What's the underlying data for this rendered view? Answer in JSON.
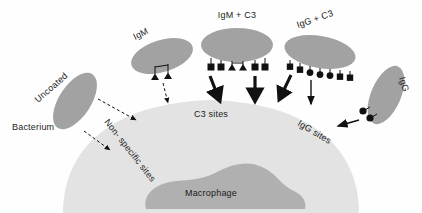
{
  "figure": {
    "background_color": "#fefefe"
  },
  "colors": {
    "bacterium_fill": "#a2a2a2",
    "macrophage_body_fill": "#e3e3e3",
    "macrophage_nucleus_fill": "#b0b0b0",
    "marker_color": "#111111",
    "arrow_color": "#111111",
    "text_color": "#1b1b1b"
  },
  "labels": {
    "bacterium": "Bacterium",
    "uncoated": "Uncoated",
    "igm": "IgM",
    "igm_c3": "IgM + C3",
    "igg_c3": "IgG + C3",
    "igg": "IgG",
    "nonspecific_sites": "Non- specific  sites",
    "c3_sites": "C3 sites",
    "igg_sites": "IgG sites",
    "macrophage": "Macrophage"
  },
  "bacteria": [
    {
      "id": "uncoated",
      "label": "Uncoated",
      "coating": "none",
      "marker_count": 0,
      "arrow_style": "dashed",
      "arrow_count": 2,
      "target": "Non- specific  sites"
    },
    {
      "id": "igm",
      "label": "IgM",
      "coating": "IgM",
      "marker_shapes": [
        "triangle",
        "triangle"
      ],
      "marker_count": 2,
      "arrow_style": "dashed",
      "arrow_count": 1,
      "target": "Non- specific  sites"
    },
    {
      "id": "igm-c3",
      "label": "IgM + C3",
      "coating": "IgM + C3",
      "marker_shapes": [
        "square",
        "square",
        "triangle",
        "triangle",
        "square",
        "square"
      ],
      "marker_count": 6,
      "arrow_style": "thick-solid",
      "arrow_count": 2,
      "target": "C3 sites"
    },
    {
      "id": "igg-c3",
      "label": "IgG + C3",
      "coating": "IgG + C3",
      "marker_shapes": [
        "square",
        "square",
        "circle",
        "circle",
        "circle",
        "square",
        "square"
      ],
      "marker_count": 7,
      "arrow_style": "mixed-solid",
      "arrow_count": 2,
      "target": "C3 sites"
    },
    {
      "id": "igg",
      "label": "IgG",
      "coating": "IgG",
      "marker_shapes": [
        "circle",
        "circle"
      ],
      "marker_count": 2,
      "arrow_style": "thin-solid",
      "arrow_count": 1,
      "target": "IgG sites"
    }
  ],
  "receptor_sites": [
    {
      "id": "nonspecific",
      "label": "Non- specific  sites"
    },
    {
      "id": "c3",
      "label": "C3 sites"
    },
    {
      "id": "igg",
      "label": "IgG sites"
    }
  ],
  "cell": {
    "name": "Macrophage",
    "nucleus_label": "Macrophage"
  }
}
